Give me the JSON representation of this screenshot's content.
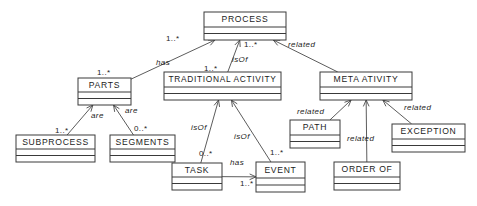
{
  "diagram": {
    "type": "uml-class-diagram",
    "stroke_color": "#3a3a3a",
    "edge_color": "#4a4a4a",
    "background": "#ffffff",
    "classes": [
      {
        "id": "process",
        "name": "PROCESS",
        "x": 204,
        "y": 12,
        "w": 82,
        "h": 28
      },
      {
        "id": "parts",
        "name": "PARTS",
        "x": 78,
        "y": 78,
        "w": 53,
        "h": 27
      },
      {
        "id": "tradact",
        "name": "TRADITIONAL ACTIVITY",
        "x": 164,
        "y": 72,
        "w": 117,
        "h": 28
      },
      {
        "id": "metaact",
        "name": "META ATIVITY",
        "x": 320,
        "y": 72,
        "w": 92,
        "h": 28
      },
      {
        "id": "subprocess",
        "name": "SUBPROCESS",
        "x": 16,
        "y": 135,
        "w": 79,
        "h": 27
      },
      {
        "id": "segments",
        "name": "SEGMENTS",
        "x": 110,
        "y": 135,
        "w": 65,
        "h": 27
      },
      {
        "id": "path",
        "name": "PATH",
        "x": 290,
        "y": 120,
        "w": 50,
        "h": 28
      },
      {
        "id": "exception",
        "name": "EXCEPTION",
        "x": 392,
        "y": 124,
        "w": 73,
        "h": 28
      },
      {
        "id": "task",
        "name": "TASK",
        "x": 172,
        "y": 163,
        "w": 50,
        "h": 27
      },
      {
        "id": "event",
        "name": "EVENT",
        "x": 256,
        "y": 162,
        "w": 49,
        "h": 30
      },
      {
        "id": "orderof",
        "name": "ORDER OF",
        "x": 334,
        "y": 162,
        "w": 66,
        "h": 28
      }
    ],
    "relations": [
      {
        "id": "r-process-parts",
        "from": "parts",
        "to": "process",
        "role": "has",
        "source_mult": "1..*",
        "target_mult": ""
      },
      {
        "id": "r-process-tradact",
        "from": "tradact",
        "to": "process",
        "role": "isOf",
        "source_mult": "1..*",
        "target_mult": "1..*"
      },
      {
        "id": "r-process-metaact",
        "from": "metaact",
        "to": "process",
        "role": "related",
        "source_mult": "",
        "target_mult": ""
      },
      {
        "id": "r-parts-subprocess",
        "from": "subprocess",
        "to": "parts",
        "role": "are",
        "source_mult": "1..*",
        "target_mult": ""
      },
      {
        "id": "r-parts-segments",
        "from": "segments",
        "to": "parts",
        "role": "are",
        "source_mult": "0..*",
        "target_mult": ""
      },
      {
        "id": "r-tradact-task",
        "from": "task",
        "to": "tradact",
        "role": "isOf",
        "source_mult": "0..*",
        "target_mult": ""
      },
      {
        "id": "r-tradact-event",
        "from": "event",
        "to": "tradact",
        "role": "isOf",
        "source_mult": "1..*",
        "target_mult": ""
      },
      {
        "id": "r-task-event",
        "from": "task",
        "to": "event",
        "role": "has",
        "source_mult": "1..*",
        "target_mult": ""
      },
      {
        "id": "r-metaact-path",
        "from": "path",
        "to": "metaact",
        "role": "related",
        "source_mult": "",
        "target_mult": ""
      },
      {
        "id": "r-metaact-orderof",
        "from": "orderof",
        "to": "metaact",
        "role": "related",
        "source_mult": "",
        "target_mult": ""
      },
      {
        "id": "r-metaact-exception",
        "from": "exception",
        "to": "metaact",
        "role": "related",
        "source_mult": "",
        "target_mult": ""
      }
    ],
    "labels": [
      {
        "id": "l-has-process",
        "text": "has",
        "kind": "role",
        "x": 156,
        "y": 65
      },
      {
        "id": "l-isof-process",
        "text": "isOf",
        "kind": "role",
        "x": 232,
        "y": 62
      },
      {
        "id": "l-related-process",
        "text": "related",
        "kind": "role",
        "x": 288,
        "y": 47
      },
      {
        "id": "l-are-subprocess",
        "text": "are",
        "kind": "role",
        "x": 91,
        "y": 118
      },
      {
        "id": "l-are-segments",
        "text": "are",
        "kind": "role",
        "x": 125,
        "y": 113
      },
      {
        "id": "l-isof-task",
        "text": "isOf",
        "kind": "role",
        "x": 191,
        "y": 130
      },
      {
        "id": "l-isof-event",
        "text": "isOf",
        "kind": "role",
        "x": 234,
        "y": 139
      },
      {
        "id": "l-has-event",
        "text": "has",
        "kind": "role",
        "x": 230,
        "y": 165
      },
      {
        "id": "l-related-path",
        "text": "related",
        "kind": "role",
        "x": 297,
        "y": 114
      },
      {
        "id": "l-related-orderof",
        "text": "related",
        "kind": "role",
        "x": 347,
        "y": 141
      },
      {
        "id": "l-related-exception",
        "text": "related",
        "kind": "role",
        "x": 404,
        "y": 110
      },
      {
        "id": "m-parts-process",
        "text": "1..*",
        "kind": "mult",
        "x": 166,
        "y": 41
      },
      {
        "id": "m-tradact-process",
        "text": "1..*",
        "kind": "mult",
        "x": 244,
        "y": 47
      },
      {
        "id": "m-tradact-up",
        "text": "1..*",
        "kind": "mult",
        "x": 204,
        "y": 71
      },
      {
        "id": "m-parts-up",
        "text": "1..*",
        "kind": "mult",
        "x": 97,
        "y": 75
      },
      {
        "id": "m-subprocess",
        "text": "1..*",
        "kind": "mult",
        "x": 55,
        "y": 133
      },
      {
        "id": "m-segments",
        "text": "0..*",
        "kind": "mult",
        "x": 134,
        "y": 131
      },
      {
        "id": "m-task-isof",
        "text": "0..*",
        "kind": "mult",
        "x": 199,
        "y": 156
      },
      {
        "id": "m-event-isof",
        "text": "1..*",
        "kind": "mult",
        "x": 270,
        "y": 155
      },
      {
        "id": "m-task-event",
        "text": "1..*",
        "kind": "mult",
        "x": 240,
        "y": 186
      }
    ]
  }
}
